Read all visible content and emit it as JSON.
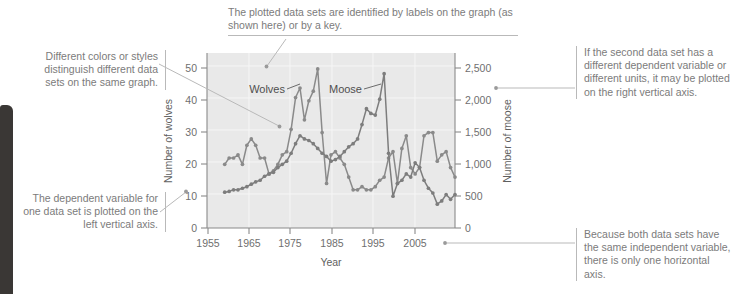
{
  "figure": {
    "annotations": [
      {
        "id": "datasets",
        "text": "The plotted data sets are identified by labels on the graph (as shown here) or by a key.",
        "side": "top"
      },
      {
        "id": "colors",
        "text": "Different colors or styles distinguish different data sets on the same graph.",
        "side": "left"
      },
      {
        "id": "dependent",
        "text": "The dependent variable for one data set is plotted on the left vertical axis.",
        "side": "left"
      },
      {
        "id": "second",
        "text": "If the second data set has a different dependent variable or different units, it may be plotted on the right vertical axis.",
        "side": "right"
      },
      {
        "id": "independent",
        "text": "Because both data sets have the same independent variable, there is only one horizontal axis.",
        "side": "right"
      }
    ]
  },
  "chart_data": {
    "type": "line",
    "title": "",
    "xlabel": "Year",
    "ylabel": "Number of wolves",
    "y2label": "Number of moose",
    "xlim": [
      1955,
      2011
    ],
    "ylim": [
      0,
      55
    ],
    "y2lim": [
      0,
      2750
    ],
    "xticks": [
      1955,
      1965,
      1975,
      1985,
      1995,
      2005
    ],
    "xticklabels": [
      "1955",
      "1965",
      "1975",
      "1985",
      "1995",
      "2005"
    ],
    "yticks": [
      0,
      10,
      20,
      30,
      40,
      50
    ],
    "yticklabels": [
      "0",
      "10",
      "20",
      "30",
      "40",
      "50"
    ],
    "y2ticks": [
      0,
      500,
      1000,
      1500,
      2000,
      2500
    ],
    "y2ticklabels": [
      "0",
      "500",
      "1,000",
      "1,500",
      "2,000",
      "2,500"
    ],
    "grid": true,
    "legend_position": "on-graph-labels",
    "colors": {
      "wolves": "#8a8a8a",
      "moose": "#7d7d7d",
      "plot_bg": "#e9e9e9",
      "axis": "#8a8a8a"
    },
    "series": [
      {
        "name": "Wolves",
        "axis": "left",
        "label_text": "Wolves",
        "x": [
          1959,
          1960,
          1961,
          1962,
          1963,
          1964,
          1965,
          1966,
          1967,
          1968,
          1969,
          1970,
          1971,
          1972,
          1973,
          1974,
          1975,
          1976,
          1977,
          1978,
          1979,
          1980,
          1981,
          1982,
          1983,
          1984,
          1985,
          1986,
          1987,
          1988,
          1989,
          1990,
          1991,
          1992,
          1993,
          1994,
          1995,
          1996,
          1997,
          1998,
          1999,
          2000,
          2001,
          2002,
          2003,
          2004,
          2005,
          2006,
          2007,
          2008,
          2009,
          2010,
          2011
        ],
        "values": [
          20,
          22,
          22,
          23,
          20,
          26,
          28,
          26,
          22,
          22,
          17,
          18,
          20,
          23,
          24,
          31,
          41,
          44,
          34,
          40,
          43,
          50,
          30,
          14,
          23,
          24,
          22,
          20,
          16,
          12,
          12,
          13,
          12,
          12,
          13,
          15,
          16,
          22,
          24,
          14,
          25,
          29,
          19,
          17,
          19,
          29,
          30,
          30,
          21,
          23,
          24,
          19,
          16
        ]
      },
      {
        "name": "Moose",
        "axis": "right",
        "label_text": "Moose",
        "x": [
          1959,
          1960,
          1961,
          1962,
          1963,
          1964,
          1965,
          1966,
          1967,
          1968,
          1969,
          1970,
          1971,
          1972,
          1973,
          1974,
          1975,
          1976,
          1977,
          1978,
          1979,
          1980,
          1981,
          1982,
          1983,
          1984,
          1985,
          1986,
          1987,
          1988,
          1989,
          1990,
          1991,
          1992,
          1993,
          1994,
          1995,
          1996,
          1997,
          1998,
          1999,
          2000,
          2001,
          2002,
          2003,
          2004,
          2005,
          2006,
          2007,
          2008,
          2009,
          2010,
          2011
        ],
        "values": [
          563,
          575,
          600,
          600,
          625,
          650,
          688,
          725,
          750,
          813,
          850,
          875,
          950,
          1000,
          1050,
          1175,
          1325,
          1450,
          1400,
          1375,
          1325,
          1250,
          1175,
          1125,
          1050,
          1075,
          1125,
          1200,
          1275,
          1325,
          1400,
          1625,
          1875,
          1800,
          1775,
          2025,
          2425,
          1175,
          500,
          700,
          750,
          850,
          800,
          1025,
          950,
          750,
          625,
          550,
          375,
          425,
          525,
          450,
          525
        ]
      }
    ]
  }
}
